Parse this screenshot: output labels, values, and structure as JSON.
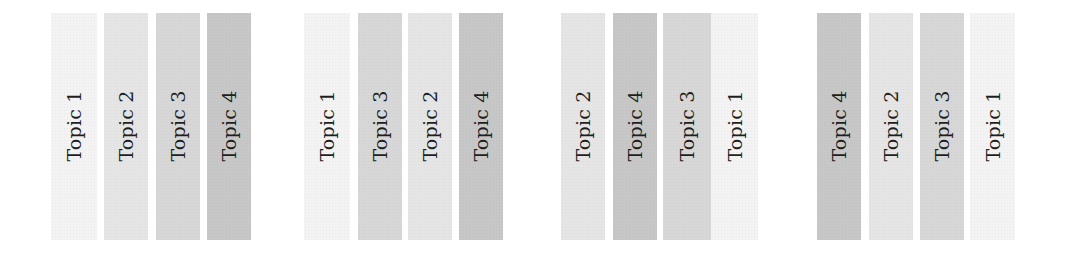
{
  "diagram": {
    "topic_colors": {
      "Topic 1": "#f3f3f3",
      "Topic 2": "#e5e5e5",
      "Topic 3": "#d7d7d7",
      "Topic 4": "#c7c7c7"
    },
    "groups": [
      {
        "strips": [
          {
            "label": "Topic 1"
          },
          {
            "label": "Topic 2"
          },
          {
            "label": "Topic 3"
          },
          {
            "label": "Topic 4"
          }
        ]
      },
      {
        "strips": [
          {
            "label": "Topic 1"
          },
          {
            "label": "Topic 3"
          },
          {
            "label": "Topic 2"
          },
          {
            "label": "Topic 4"
          }
        ]
      },
      {
        "strips": [
          {
            "label": "Topic 2"
          },
          {
            "label": "Topic 4"
          },
          {
            "label": "Topic 3"
          },
          {
            "label": "Topic 1"
          }
        ]
      },
      {
        "strips": [
          {
            "label": "Topic 4"
          },
          {
            "label": "Topic 2"
          },
          {
            "label": "Topic 3"
          },
          {
            "label": "Topic 1"
          }
        ]
      }
    ]
  }
}
